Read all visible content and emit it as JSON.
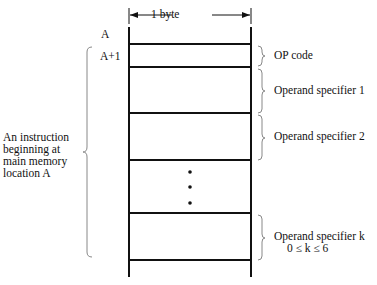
{
  "diagram": {
    "width_label": "1 byte",
    "addresses": [
      "A",
      "A+1"
    ],
    "fields": [
      {
        "label": "OP code"
      },
      {
        "label": "Operand specifier 1"
      },
      {
        "label": "Operand specifier 2"
      },
      {
        "label": "Operand specifier k",
        "sublabel": "0 ≤ k ≤ 6"
      }
    ],
    "ellipsis": "• • •",
    "instruction_note": [
      "An instruction",
      "beginning at",
      "main memory",
      "location A"
    ],
    "colors": {
      "line": "#111111",
      "brace": "#888888",
      "background": "#ffffff"
    }
  }
}
